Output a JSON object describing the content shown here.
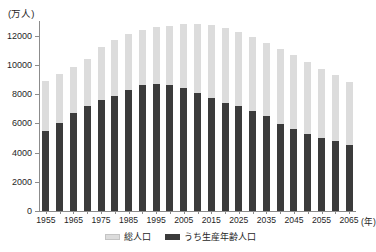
{
  "chart_data": {
    "type": "bar",
    "stacked_overlay": true,
    "title": "",
    "subtitle": "",
    "xlabel": "(年)",
    "ylabel": "(万人)",
    "ylim": [
      0,
      13000
    ],
    "ytick_values": [
      0,
      2000,
      4000,
      6000,
      8000,
      10000,
      12000
    ],
    "ytick_labels": [
      "0",
      "2000",
      "4000",
      "6000",
      "8000",
      "10000",
      "12000"
    ],
    "grid": false,
    "legend_position": "bottom",
    "categories": [
      "1955",
      "1960",
      "1965",
      "1970",
      "1975",
      "1980",
      "1985",
      "1990",
      "1995",
      "2000",
      "2005",
      "2010",
      "2015",
      "2020",
      "2025",
      "2030",
      "2035",
      "2040",
      "2045",
      "2050",
      "2055",
      "2060",
      "2065"
    ],
    "xtick_labels": [
      "1955",
      "1965",
      "1975",
      "1985",
      "1995",
      "2005",
      "2015",
      "2025",
      "2035",
      "2045",
      "2055",
      "2065"
    ],
    "series": [
      {
        "name": "総人口",
        "color": "#dcdcdc",
        "values": [
          8928,
          9342,
          9828,
          10372,
          11194,
          11706,
          12105,
          12361,
          12557,
          12693,
          12777,
          12806,
          12709,
          12532,
          12254,
          11913,
          11522,
          11092,
          10642,
          10192,
          9744,
          9284,
          8808
        ]
      },
      {
        "name": "うち生産年齢人口",
        "color": "#3b3b3b",
        "values": [
          5473,
          6000,
          6693,
          7212,
          7581,
          7884,
          8251,
          8590,
          8716,
          8622,
          8409,
          8103,
          7728,
          7406,
          7170,
          6875,
          6494,
          5978,
          5584,
          5275,
          5028,
          4793,
          4529
        ]
      }
    ]
  },
  "legend": {
    "items": [
      {
        "label": "総人口",
        "swatch": "total-swatch"
      },
      {
        "label": "うち生産年齢人口",
        "swatch": "working-age-swatch"
      }
    ]
  },
  "axis": {
    "y_unit": "(万人)",
    "x_unit": "(年)"
  }
}
